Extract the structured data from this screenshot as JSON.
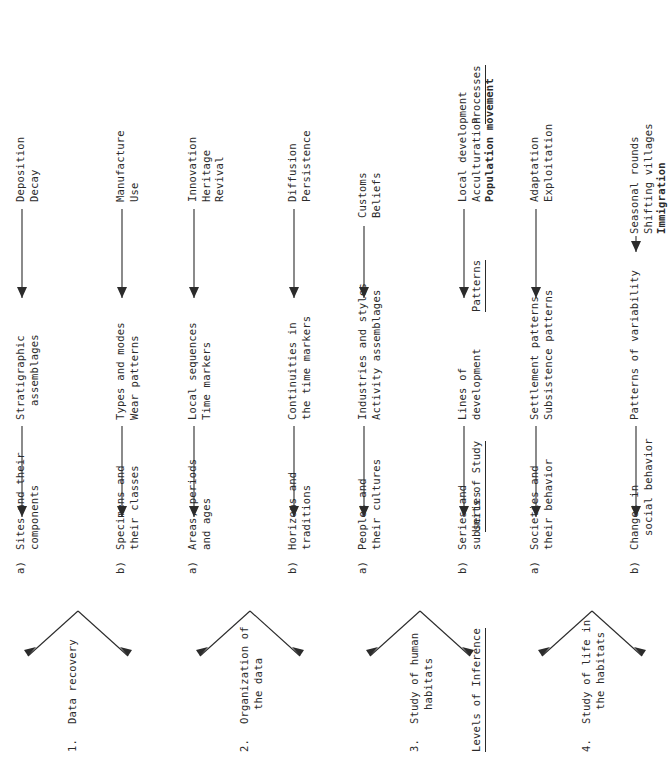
{
  "diagram": {
    "orientation": "rotated-90-ccw",
    "columns": [
      {
        "id": "levels",
        "label": "Levels of Inference",
        "underlined": true
      },
      {
        "id": "units",
        "label": "Units of Study",
        "underlined": true
      },
      {
        "id": "patterns",
        "label": "Patterns",
        "underlined": true
      },
      {
        "id": "processes",
        "label": "Processes",
        "underlined": true
      }
    ],
    "levels": [
      {
        "number": "1.",
        "name": "Data recovery",
        "name_line2": "",
        "branches": [
          {
            "tag": "a)",
            "unit": "Sites and their",
            "unit_line2": "components",
            "pattern": "Stratigraphic",
            "pattern_line2": "assemblages",
            "processes": [
              "Deposition",
              "Decay"
            ],
            "processes_bold": [
              false,
              false
            ]
          },
          {
            "tag": "b)",
            "unit": "Specimens and",
            "unit_line2": "their classes",
            "pattern": "Types and modes",
            "pattern_line2": "Wear patterns",
            "processes": [
              "Manufacture",
              "Use"
            ],
            "processes_bold": [
              false,
              false
            ]
          }
        ]
      },
      {
        "number": "2.",
        "name": "Organization of",
        "name_line2": "the data",
        "branches": [
          {
            "tag": "a)",
            "unit": "Areas, periods",
            "unit_line2": "and ages",
            "pattern": "Local sequences",
            "pattern_line2": "Time markers",
            "processes": [
              "Innovation",
              "Heritage",
              "Revival"
            ],
            "processes_bold": [
              false,
              false,
              false
            ]
          },
          {
            "tag": "b)",
            "unit": "Horizons and",
            "unit_line2": "traditions",
            "pattern": "Continuities in",
            "pattern_line2": "the time markers",
            "processes": [
              "Diffusion",
              "Persistence"
            ],
            "processes_bold": [
              false,
              false
            ]
          }
        ]
      },
      {
        "number": "3.",
        "name": "Study of human",
        "name_line2": "habitats",
        "branches": [
          {
            "tag": "a)",
            "unit": "Peoples and",
            "unit_line2": "their cultures",
            "pattern": "Industries and styles",
            "pattern_line2": "Activity assemblages",
            "processes": [
              "Customs",
              "Beliefs"
            ],
            "processes_bold": [
              false,
              false
            ]
          },
          {
            "tag": "b)",
            "unit": "Series and",
            "unit_line2": "subseries",
            "pattern": "Lines of",
            "pattern_line2": "development",
            "processes": [
              "Local development",
              "Acculturation",
              "Population movement"
            ],
            "processes_bold": [
              false,
              false,
              true
            ]
          }
        ]
      },
      {
        "number": "4.",
        "name": "Study of life in",
        "name_line2": "the habitats",
        "branches": [
          {
            "tag": "a)",
            "unit": "Societies and",
            "unit_line2": "their behavior",
            "pattern": "Settlement patterns",
            "pattern_line2": "Subsistence patterns",
            "processes": [
              "Adaptation",
              "Exploitation"
            ],
            "processes_bold": [
              false,
              false
            ]
          },
          {
            "tag": "b)",
            "unit": "Changes in",
            "unit_line2": "social behavior",
            "pattern": "Patterns of variability",
            "pattern_line2": "",
            "processes": [
              "Seasonal rounds",
              "Shifting villages",
              "Immigration"
            ],
            "processes_bold": [
              false,
              false,
              true
            ]
          }
        ]
      }
    ]
  }
}
